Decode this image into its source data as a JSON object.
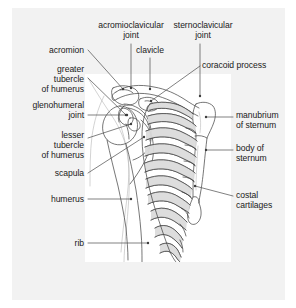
{
  "figure": {
    "view": "anterior",
    "background_color": "#ffffff",
    "panel_color": "#f2f2f2",
    "plate_color": "#ffffff",
    "line_color": "#3c3c3c",
    "text_color": "#1a1a1a",
    "shading_color": "#d9d9d9"
  },
  "labels": [
    {
      "id": "acromioclavicular-joint",
      "text": "acromioclavicular\njoint",
      "align": "center",
      "x": 88,
      "y": 20,
      "width": 86,
      "leader": [
        [
          131,
          44
        ],
        [
          131,
          88
        ]
      ]
    },
    {
      "id": "sternoclavicular-joint",
      "text": "sternoclavicular\njoint",
      "align": "center",
      "x": 163,
      "y": 20,
      "width": 80,
      "leader": [
        [
          200,
          44
        ],
        [
          200,
          96
        ]
      ]
    },
    {
      "id": "clavicle",
      "text": "clavicle",
      "align": "center",
      "x": 130,
      "y": 45,
      "width": 40,
      "leader": [
        [
          150,
          58
        ],
        [
          150,
          89
        ]
      ]
    },
    {
      "id": "acromion",
      "text": "acromion",
      "align": "right",
      "x": 28,
      "y": 45,
      "width": 56,
      "leader": [
        [
          88,
          50
        ],
        [
          123,
          89
        ]
      ]
    },
    {
      "id": "coracoid-process",
      "text": "coracoid process",
      "align": "left",
      "x": 202,
      "y": 60,
      "width": 86,
      "leader": [
        [
          200,
          66
        ],
        [
          151,
          101
        ]
      ]
    },
    {
      "id": "greater-tubercle-of-humerus",
      "text": "greater\ntubercle\nof humerus",
      "align": "right",
      "x": 18,
      "y": 64,
      "width": 66,
      "leader": [
        [
          88,
          78
        ],
        [
          126,
          115
        ]
      ]
    },
    {
      "id": "glenohumeral-joint",
      "text": "glenohumeral\njoint",
      "align": "right",
      "x": 12,
      "y": 100,
      "width": 72,
      "leader": [
        [
          88,
          115
        ],
        [
          127,
          115
        ]
      ]
    },
    {
      "id": "manubrium-of-sternum",
      "text": "manubrium\nof sternum",
      "align": "left",
      "x": 236,
      "y": 110,
      "width": 58,
      "leader": [
        [
          233,
          117
        ],
        [
          206,
          117
        ]
      ]
    },
    {
      "id": "lesser-tubercle-of-humerus",
      "text": "lesser\ntubercle\nof humerus",
      "align": "right",
      "x": 18,
      "y": 130,
      "width": 66,
      "leader": [
        [
          88,
          138
        ],
        [
          131,
          124
        ]
      ]
    },
    {
      "id": "body-of-sternum",
      "text": "body of\nsternum",
      "align": "left",
      "x": 236,
      "y": 143,
      "width": 52,
      "leader": [
        [
          233,
          150
        ],
        [
          206,
          150
        ]
      ]
    },
    {
      "id": "scapula",
      "text": "scapula",
      "align": "right",
      "x": 32,
      "y": 168,
      "width": 52,
      "leader": [
        [
          88,
          173
        ],
        [
          144,
          137
        ]
      ]
    },
    {
      "id": "humerus",
      "text": "humerus",
      "align": "right",
      "x": 28,
      "y": 194,
      "width": 56,
      "leader": [
        [
          88,
          199
        ],
        [
          131,
          199
        ]
      ]
    },
    {
      "id": "costal-cartilages",
      "text": "costal\ncartilages",
      "align": "left",
      "x": 236,
      "y": 190,
      "width": 54,
      "leader": [
        [
          233,
          196
        ],
        [
          195,
          186
        ]
      ]
    },
    {
      "id": "rib",
      "text": "rib",
      "align": "right",
      "x": 58,
      "y": 238,
      "width": 26,
      "leader": [
        [
          88,
          243
        ],
        [
          148,
          243
        ]
      ]
    }
  ],
  "structures": [
    {
      "id": "clavicle-bone",
      "name": "clavicle"
    },
    {
      "id": "scapula-bone",
      "name": "scapula"
    },
    {
      "id": "acromion-process",
      "name": "acromion"
    },
    {
      "id": "coracoid-process-bone",
      "name": "coracoid process"
    },
    {
      "id": "humerus-bone",
      "name": "humerus"
    },
    {
      "id": "humeral-head",
      "name": "head of humerus"
    },
    {
      "id": "greater-tubercle",
      "name": "greater tubercle"
    },
    {
      "id": "lesser-tubercle",
      "name": "lesser tubercle"
    },
    {
      "id": "manubrium",
      "name": "manubrium of sternum"
    },
    {
      "id": "sternum-body",
      "name": "body of sternum"
    },
    {
      "id": "xiphoid-process",
      "name": "xiphoid process"
    },
    {
      "id": "ribs",
      "name": "ribs",
      "count": 10
    },
    {
      "id": "costal-cartilages",
      "name": "costal cartilages"
    }
  ]
}
